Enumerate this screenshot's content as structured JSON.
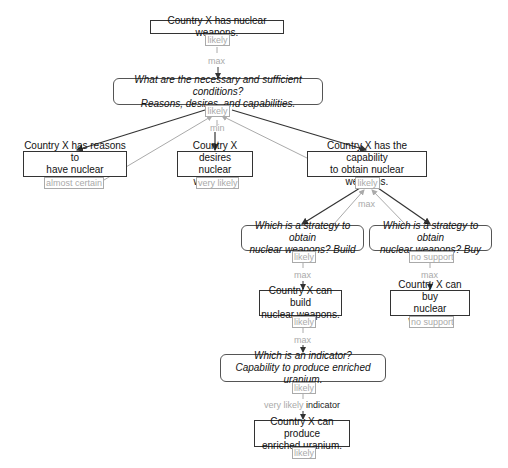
{
  "nodes": {
    "root": {
      "line1": "Country X has nuclear weapons.",
      "label": "likely"
    },
    "q_conditions": {
      "line1": "What are the necessary and sufficient conditions?",
      "line2": "Reasons, desires, and capabilities.",
      "label": "likely"
    },
    "reasons": {
      "line1": "Country X has reasons to",
      "line2": "have nuclear weapons.",
      "label": "almost certain"
    },
    "desires": {
      "line1": "Country X desires",
      "line2": "nuclear weapons.",
      "label": "very likely"
    },
    "capability": {
      "line1": "Country X has the capability",
      "line2": "to obtain nuclear weapons.",
      "label": "likely"
    },
    "q_build": {
      "line1": "Which is a strategy to obtain",
      "line2": "nuclear weapons? Build",
      "label": "likely"
    },
    "q_buy": {
      "line1": "Which is a strategy to obtain",
      "line2": "nuclear weapons? Buy",
      "label": "no support"
    },
    "build": {
      "line1": "Country X can build",
      "line2": "nuclear weapons.",
      "label": "likely"
    },
    "buy": {
      "line1": "Country X can buy",
      "line2": "nuclear weapons.",
      "label": "no support"
    },
    "q_indicator": {
      "line1": "Which is an indicator?",
      "line2": "Capability to produce enriched uranium.",
      "label": "likely"
    },
    "uranium": {
      "line1": "Country X can produce",
      "line2": "enriched uranium.",
      "label": "likely"
    }
  },
  "operators": {
    "root_to_conditions": "max",
    "conditions_combine": "min",
    "capability_combine": "max",
    "build_q_to_node": "max",
    "buy_q_to_node": "max",
    "build_to_indicator": "max",
    "indicator_value": "very likely",
    "indicator_word": "indicator"
  },
  "colors": {
    "edge_dark": "#333333",
    "edge_light": "#aaaaaa",
    "label_text": "#aaaaaa"
  }
}
